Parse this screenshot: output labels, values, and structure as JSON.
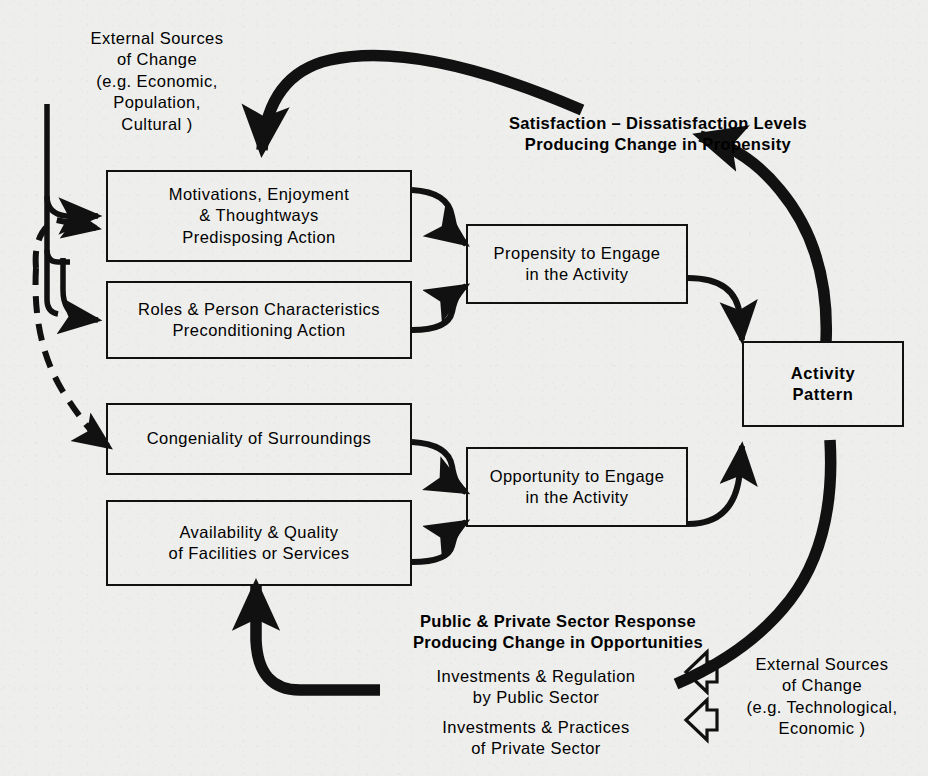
{
  "diagram": {
    "background_color": "#eeeeec",
    "ink_color": "#111111"
  },
  "nodes": [
    {
      "id": "motivations",
      "name": "motivations-box",
      "label": "Motivations, Enjoyment\n& Thoughtways\nPredisposing Action",
      "bold": false
    },
    {
      "id": "roles",
      "name": "roles-box",
      "label": "Roles & Person Characteristics\nPreconditioning Action",
      "bold": false
    },
    {
      "id": "congeniality",
      "name": "congeniality-box",
      "label": "Congeniality of  Surroundings",
      "bold": false
    },
    {
      "id": "availability",
      "name": "availability-box",
      "label": "Availability & Quality\nof Facilities or Services",
      "bold": false
    },
    {
      "id": "propensity",
      "name": "propensity-box",
      "label": "Propensity to Engage\nin the Activity",
      "bold": false
    },
    {
      "id": "opportunity",
      "name": "opportunity-box",
      "label": "Opportunity to Engage\nin the Activity",
      "bold": false
    },
    {
      "id": "activity_pattern",
      "name": "activity-pattern-box",
      "label": "Activity\nPattern",
      "bold": true
    }
  ],
  "annotations": {
    "external_sources_top": "External Sources\nof Change\n(e.g. Economic,\nPopulation,\nCultural )",
    "satisfaction_feedback": "Satisfaction – Dissatisfaction Levels\nProducing Change in Propensity",
    "public_private_feedback": "Public & Private Sector Response\nProducing Change in Opportunities",
    "investments_public": "Investments & Regulation\nby Public Sector",
    "investments_private": "Investments & Practices\nof Private Sector",
    "external_sources_bottom": "External Sources\nof Change\n(e.g. Technological,\nEconomic )"
  },
  "edges": [
    {
      "name": "edge-satisfaction-to-motivations",
      "from": "satisfaction_feedback",
      "to": "motivations",
      "style": "thick-solid"
    },
    {
      "name": "edge-activity-to-satisfaction",
      "from": "activity_pattern",
      "to": "satisfaction_feedback",
      "style": "thick-solid"
    },
    {
      "name": "edge-external-to-motivations",
      "from": "external_sources_top",
      "to": "motivations",
      "style": "thin-solid"
    },
    {
      "name": "edge-external-to-roles",
      "from": "external_sources_top",
      "to": "roles",
      "style": "thin-solid"
    },
    {
      "name": "edge-feedback-to-motivations",
      "from": "congeniality",
      "to": "motivations",
      "style": "dashed"
    },
    {
      "name": "edge-feedback-to-congeniality",
      "from": "motivations",
      "to": "congeniality",
      "style": "dashed"
    },
    {
      "name": "edge-motivations-to-propensity",
      "from": "motivations",
      "to": "propensity",
      "style": "thin-solid"
    },
    {
      "name": "edge-roles-to-propensity",
      "from": "roles",
      "to": "propensity",
      "style": "thin-solid"
    },
    {
      "name": "edge-congeniality-to-opportunity",
      "from": "congeniality",
      "to": "opportunity",
      "style": "thin-solid"
    },
    {
      "name": "edge-availability-to-opportunity",
      "from": "availability",
      "to": "opportunity",
      "style": "thin-solid"
    },
    {
      "name": "edge-propensity-to-activity",
      "from": "propensity",
      "to": "activity_pattern",
      "style": "thin-solid"
    },
    {
      "name": "edge-opportunity-to-activity",
      "from": "opportunity",
      "to": "activity_pattern",
      "style": "thin-solid"
    },
    {
      "name": "edge-activity-to-public-private",
      "from": "activity_pattern",
      "to": "public_private_feedback",
      "style": "thick-solid"
    },
    {
      "name": "edge-investments-to-availability",
      "from": "investments_public",
      "to": "availability",
      "style": "thick-solid"
    },
    {
      "name": "edge-external-bottom-1",
      "from": "external_sources_bottom",
      "to": "investments_public",
      "style": "hollow-arrow"
    },
    {
      "name": "edge-external-bottom-2",
      "from": "external_sources_bottom",
      "to": "investments_private",
      "style": "hollow-arrow"
    }
  ]
}
